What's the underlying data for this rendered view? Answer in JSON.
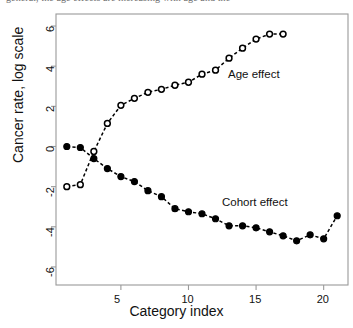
{
  "caption": {
    "cut_off_text": "general, the age effects are increasing with age and the"
  },
  "chart_data": {
    "type": "line",
    "title": "",
    "xlabel": "Category index",
    "ylabel": "Cancer rate, log scale",
    "xlim": [
      0.2,
      21.8
    ],
    "ylim": [
      -6.9,
      6.6
    ],
    "xticks": [
      5,
      10,
      15,
      20
    ],
    "yticks": [
      -6,
      -4,
      -2,
      0,
      2,
      4,
      6
    ],
    "grid": false,
    "legend_position": "inline-annotations",
    "line_style": "dashed",
    "series": [
      {
        "name": "Age effect",
        "marker": "open-circle",
        "color": "#000000",
        "annotation": "Age effect",
        "x": [
          1,
          2,
          3,
          4,
          5,
          6,
          7,
          8,
          9,
          10,
          11,
          12,
          13,
          14,
          15,
          16,
          17
        ],
        "values": [
          -2.0,
          -1.9,
          -0.25,
          1.15,
          2.05,
          2.4,
          2.7,
          2.85,
          3.05,
          3.2,
          3.6,
          3.8,
          4.4,
          4.9,
          5.35,
          5.6,
          5.6
        ]
      },
      {
        "name": "Cohort effect",
        "marker": "filled-circle",
        "color": "#000000",
        "annotation": "Cohort effect",
        "x": [
          1,
          2,
          3,
          4,
          5,
          6,
          7,
          8,
          9,
          10,
          11,
          12,
          13,
          14,
          15,
          16,
          17,
          18,
          19,
          20,
          21
        ],
        "values": [
          0.0,
          -0.05,
          -0.6,
          -1.1,
          -1.5,
          -1.75,
          -2.2,
          -2.5,
          -3.1,
          -3.25,
          -3.35,
          -3.6,
          -3.95,
          -3.95,
          -4.05,
          -4.25,
          -4.45,
          -4.7,
          -4.4,
          -4.6,
          -3.45
        ]
      }
    ]
  }
}
